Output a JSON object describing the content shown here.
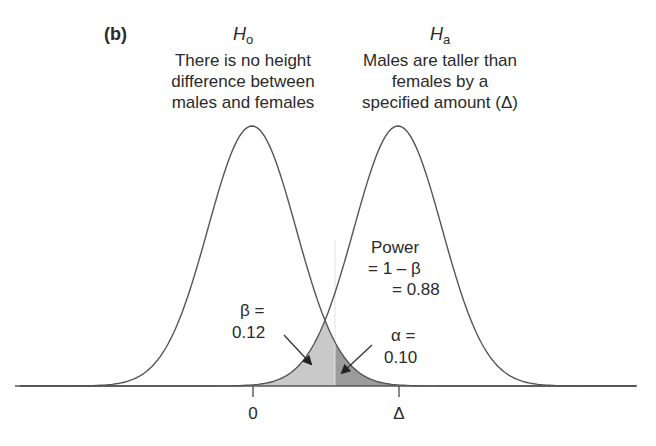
{
  "panel_label": "(b)",
  "null_hypothesis": {
    "symbol": "H",
    "subscript": "o",
    "lines": [
      "There is no height",
      "difference between",
      "males and females"
    ]
  },
  "alt_hypothesis": {
    "symbol": "H",
    "subscript": "a",
    "lines": [
      "Males are taller than",
      "females by a",
      "specified amount (Δ)"
    ]
  },
  "power_annotation": {
    "lines": [
      "Power",
      "= 1 – β",
      "= 0.88"
    ]
  },
  "beta_annotation": {
    "lines": [
      "β =",
      "0.12"
    ]
  },
  "alpha_annotation": {
    "lines": [
      "α =",
      "0.10"
    ]
  },
  "axis": {
    "ticks": [
      "0",
      "Δ"
    ]
  },
  "colors": {
    "line": "#555555",
    "beta_fill": "#c8c8c8",
    "alpha_fill": "#9a9a9a",
    "text": "#2a2a2a"
  },
  "chart_data": {
    "type": "line",
    "title": "(b)",
    "series": [
      {
        "name": "H0 distribution",
        "mean": 0,
        "label": "There is no height difference between males and females"
      },
      {
        "name": "Ha distribution",
        "mean": "Δ",
        "label": "Males are taller than females by a specified amount (Δ)"
      }
    ],
    "x_ticks": [
      "0",
      "Δ"
    ],
    "shaded_regions": [
      {
        "name": "beta",
        "value": 0.12,
        "description": "Area under Ha left of critical value"
      },
      {
        "name": "alpha",
        "value": 0.1,
        "description": "Area under H0 right of critical value"
      }
    ],
    "annotations": [
      "Power = 1 – β = 0.88",
      "β = 0.12",
      "α = 0.10"
    ],
    "xlabel": "",
    "ylabel": "",
    "grid": false
  }
}
